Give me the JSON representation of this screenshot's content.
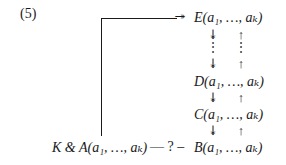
{
  "equation_number": "(5)",
  "nodes": {
    "E": "E(a₁, …, aₖ)",
    "D": "D(a₁, …, aₖ)",
    "C": "C(a₁, …, aₖ)",
    "B": "B(a₁, …, aₖ)",
    "KA": "K & A(a₁, …, aₖ)"
  },
  "relation_label": "— ? –",
  "arrows": {
    "down": "↡",
    "up": "↑",
    "into_E": "↠",
    "vdots": "⋮"
  }
}
